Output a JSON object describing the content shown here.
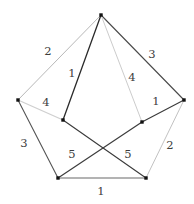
{
  "figure": {
    "kind": "edge-labeled-graph",
    "background_color": "#ffffff",
    "vertex_color": "#111111",
    "label_color": "#3d3d3d",
    "width": 194,
    "height": 204
  },
  "chart_data": {
    "type": "graph",
    "title": "",
    "nodes": [
      {
        "id": "top",
        "name": "top-vertex",
        "x": 101,
        "y": 15
      },
      {
        "id": "left",
        "name": "left-vertex",
        "x": 18,
        "y": 100
      },
      {
        "id": "right",
        "name": "right-vertex",
        "x": 184,
        "y": 100
      },
      {
        "id": "bottom_left",
        "name": "bottom-left-vertex",
        "x": 58,
        "y": 178
      },
      {
        "id": "bottom_right",
        "name": "bottom-right-vertex",
        "x": 146,
        "y": 178
      },
      {
        "id": "inner_left",
        "name": "inner-left-vertex",
        "x": 63,
        "y": 120
      },
      {
        "id": "inner_right",
        "name": "inner-right-vertex",
        "x": 142,
        "y": 122
      }
    ],
    "edges": [
      {
        "id": "e_top_left",
        "source": "top",
        "target": "left",
        "label": "2",
        "label_x": 48,
        "label_y": 52,
        "color": "#b8b8b8",
        "width": 1.0
      },
      {
        "id": "e_top_right",
        "source": "top",
        "target": "right",
        "label": "3",
        "label_x": 152,
        "label_y": 55,
        "color": "#4a4a4a",
        "width": 1.1
      },
      {
        "id": "e_top_innerleft",
        "source": "top",
        "target": "inner_left",
        "label": "1",
        "label_x": 72,
        "label_y": 74,
        "color": "#2b2b2b",
        "width": 1.3
      },
      {
        "id": "e_top_innerright",
        "source": "top",
        "target": "inner_right",
        "label": "4",
        "label_x": 132,
        "label_y": 78,
        "color": "#cccccc",
        "width": 1.0
      },
      {
        "id": "e_left_innerleft",
        "source": "left",
        "target": "inner_left",
        "label": "4",
        "label_x": 46,
        "label_y": 103,
        "color": "#cfcfcf",
        "width": 1.2
      },
      {
        "id": "e_right_innerright",
        "source": "right",
        "target": "inner_right",
        "label": "1",
        "label_x": 156,
        "label_y": 102,
        "color": "#3a3a3a",
        "width": 1.1
      },
      {
        "id": "e_left_bottomleft",
        "source": "left",
        "target": "bottom_left",
        "label": "3",
        "label_x": 24,
        "label_y": 144,
        "color": "#555555",
        "width": 1.1
      },
      {
        "id": "e_right_bottomright",
        "source": "right",
        "target": "bottom_right",
        "label": "2",
        "label_x": 170,
        "label_y": 146,
        "color": "#c2c2c2",
        "width": 1.0
      },
      {
        "id": "e_innerleft_bottomright",
        "source": "inner_left",
        "target": "bottom_right",
        "label": "5",
        "label_x": 128,
        "label_y": 155,
        "color": "#3a3a3a",
        "width": 1.1
      },
      {
        "id": "e_innerright_bottomleft",
        "source": "inner_right",
        "target": "bottom_left",
        "label": "5",
        "label_x": 72,
        "label_y": 155,
        "color": "#3a3a3a",
        "width": 1.1
      },
      {
        "id": "e_bottom",
        "source": "bottom_left",
        "target": "bottom_right",
        "label": "1",
        "label_x": 101,
        "label_y": 192,
        "color": "#9a9a9a",
        "width": 1.4
      }
    ],
    "labels": [
      "2",
      "3",
      "1",
      "4",
      "4",
      "1",
      "3",
      "2",
      "5",
      "5",
      "1"
    ]
  }
}
